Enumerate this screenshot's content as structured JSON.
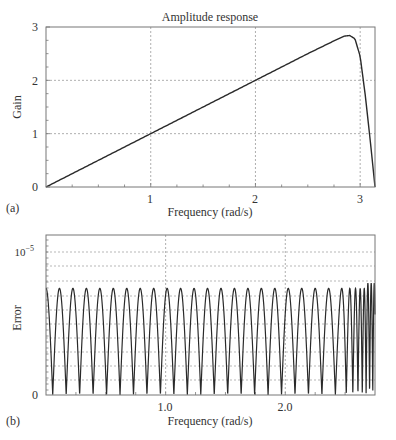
{
  "chart_data": [
    {
      "panel": "(a)",
      "type": "line",
      "title": "Amplitude response",
      "xlabel": "Frequency (rad/s)",
      "ylabel": "Gain",
      "xlim": [
        0,
        3.1416
      ],
      "ylim": [
        0,
        3
      ],
      "xticks": [
        1,
        2,
        3
      ],
      "xtick_labels": [
        "1",
        "2",
        "3"
      ],
      "yticks": [
        0,
        1,
        2,
        3
      ],
      "ytick_labels": [
        "0",
        "1",
        "2",
        "3"
      ],
      "grid": true,
      "description": "Differentiator response: gain approx equals frequency, linear from 0 up to peak ~2.85 near 2.9 rad/s, then falls sharply to 0 at pi",
      "x": [
        0,
        0.5,
        1.0,
        1.5,
        2.0,
        2.5,
        2.75,
        2.85,
        2.9,
        2.95,
        3.0,
        3.05,
        3.1,
        3.1416
      ],
      "y": [
        0,
        0.5,
        1.0,
        1.5,
        2.0,
        2.5,
        2.74,
        2.83,
        2.84,
        2.78,
        2.45,
        1.7,
        0.8,
        0
      ]
    },
    {
      "panel": "(b)",
      "type": "line",
      "title": "",
      "xlabel": "Frequency (rad/s)",
      "ylabel": "Error",
      "xlim": [
        0,
        2.75
      ],
      "ylim": [
        0,
        1.2e-05
      ],
      "xticks": [
        1.0,
        2.0
      ],
      "xtick_labels": [
        "1.0",
        "2.0"
      ],
      "yticks": [
        0,
        1e-05
      ],
      "ytick_labels": [
        "0",
        "10^-5"
      ],
      "grid": true,
      "description": "Equiripple error magnitude oscillating between 0 and ~0.8e-5, about 25 ripples over the band, ripples compress near the band edge",
      "ripple_peak": 8e-06,
      "ripple_count": 25,
      "ripple_spacing": 0.1125
    }
  ],
  "panel_a": {
    "title": "Amplitude response",
    "xlabel": "Frequency (rad/s)",
    "ylabel": "Gain",
    "label": "(a)",
    "xt": [
      "1",
      "2",
      "3"
    ],
    "yt": [
      "0",
      "1",
      "2",
      "3"
    ]
  },
  "panel_b": {
    "xlabel": "Frequency (rad/s)",
    "ylabel": "Error",
    "label": "(b)",
    "xt": [
      "1.0",
      "2.0"
    ],
    "y0": "0",
    "y_exp_base": "10",
    "y_exp_pow": "−5"
  },
  "colors": {
    "line": "#2a2a2a",
    "grid": "#9a9a9a",
    "frame": "#777777"
  }
}
